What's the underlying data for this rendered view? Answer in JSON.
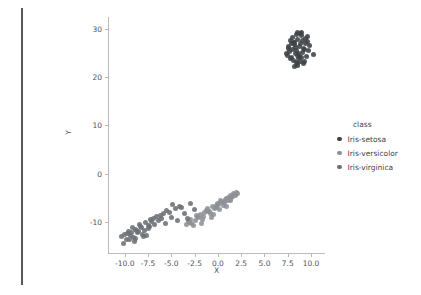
{
  "figure": {
    "background": "#ffffff",
    "panel_edge_color": "#555a5e"
  },
  "axis": {
    "xlabel": "X",
    "ylabel": "Y",
    "x_ticks": [
      "-10.0",
      "-7.5",
      "-5.0",
      "-2.5",
      "0.0",
      "2.5",
      "5.0",
      "7.5",
      "10.0"
    ],
    "y_ticks": [
      "30",
      "20",
      "10",
      "0",
      "-10"
    ],
    "spine_color": "#b8bcc0",
    "tick_text_color": "#4e5357"
  },
  "legend": {
    "title": "class",
    "entries": [
      {
        "label": "Iris-setosa",
        "color": "#3f4246"
      },
      {
        "label": "Iris-versicolor",
        "color": "#8d9195"
      },
      {
        "label": "Iris-virginica",
        "color": "#6c7075"
      }
    ]
  },
  "chart_data": {
    "type": "scatter",
    "title": "",
    "xlabel": "X",
    "ylabel": "Y",
    "xlim": [
      -11.8,
      11.5
    ],
    "ylim": [
      -16.5,
      32.5
    ],
    "x_ticks": [
      -10.0,
      -7.5,
      -5.0,
      -2.5,
      0.0,
      2.5,
      5.0,
      7.5,
      10.0
    ],
    "y_ticks": [
      30,
      20,
      10,
      0,
      -10
    ],
    "grid": false,
    "legend_title": "class",
    "legend_position": "right",
    "marker_size": 5,
    "series": [
      {
        "name": "Iris-setosa",
        "color": "#3f4246",
        "points": [
          [
            8.6,
            27.9
          ],
          [
            9.0,
            28.6
          ],
          [
            8.2,
            27.2
          ],
          [
            9.4,
            28.0
          ],
          [
            8.8,
            26.4
          ],
          [
            7.9,
            26.9
          ],
          [
            9.2,
            26.0
          ],
          [
            8.4,
            25.6
          ],
          [
            9.6,
            27.4
          ],
          [
            8.0,
            28.3
          ],
          [
            8.9,
            29.0
          ],
          [
            7.6,
            25.9
          ],
          [
            9.8,
            26.6
          ],
          [
            8.3,
            24.9
          ],
          [
            9.1,
            25.2
          ],
          [
            7.8,
            27.6
          ],
          [
            8.7,
            23.8
          ],
          [
            9.5,
            24.4
          ],
          [
            8.1,
            23.5
          ],
          [
            8.5,
            22.9
          ],
          [
            9.3,
            23.2
          ],
          [
            7.5,
            24.6
          ],
          [
            10.3,
            24.8
          ],
          [
            8.6,
            22.4
          ],
          [
            9.0,
            24.1
          ],
          [
            7.7,
            25.3
          ],
          [
            8.2,
            26.8
          ],
          [
            9.7,
            25.5
          ],
          [
            8.9,
            27.1
          ],
          [
            8.4,
            28.8
          ],
          [
            7.4,
            25.0
          ],
          [
            9.2,
            22.8
          ],
          [
            8.0,
            25.7
          ],
          [
            8.8,
            24.3
          ],
          [
            9.4,
            26.9
          ],
          [
            7.9,
            24.1
          ],
          [
            8.5,
            29.3
          ],
          [
            9.1,
            27.7
          ],
          [
            8.3,
            26.2
          ],
          [
            8.7,
            25.0
          ],
          [
            7.6,
            26.4
          ],
          [
            9.6,
            28.5
          ],
          [
            8.1,
            27.3
          ],
          [
            8.9,
            23.3
          ],
          [
            9.3,
            25.8
          ],
          [
            7.8,
            23.9
          ],
          [
            8.4,
            23.1
          ],
          [
            9.0,
            29.2
          ],
          [
            8.6,
            24.6
          ],
          [
            8.2,
            22.2
          ]
        ]
      },
      {
        "name": "Iris-versicolor",
        "color": "#8d9195",
        "points": [
          [
            -1.9,
            -8.5
          ],
          [
            -0.6,
            -6.9
          ],
          [
            0.4,
            -5.8
          ],
          [
            1.1,
            -4.9
          ],
          [
            -2.4,
            -9.8
          ],
          [
            -1.2,
            -7.6
          ],
          [
            0.9,
            -5.2
          ],
          [
            1.8,
            -4.3
          ],
          [
            -0.2,
            -7.0
          ],
          [
            -2.8,
            -10.4
          ],
          [
            0.1,
            -6.4
          ],
          [
            1.5,
            -5.0
          ],
          [
            -1.5,
            -8.9
          ],
          [
            -0.9,
            -7.9
          ],
          [
            0.7,
            -6.1
          ],
          [
            2.0,
            -3.9
          ],
          [
            -2.1,
            -9.2
          ],
          [
            -0.4,
            -7.3
          ],
          [
            1.3,
            -4.6
          ],
          [
            -3.1,
            -10.1
          ],
          [
            0.3,
            -5.5
          ],
          [
            -1.7,
            -9.5
          ],
          [
            1.7,
            -4.1
          ],
          [
            -0.8,
            -8.2
          ],
          [
            0.6,
            -6.7
          ],
          [
            -2.6,
            -10.8
          ],
          [
            1.0,
            -5.6
          ],
          [
            -1.1,
            -7.2
          ],
          [
            0.0,
            -6.2
          ],
          [
            -3.4,
            -10.6
          ],
          [
            1.9,
            -4.5
          ],
          [
            -0.5,
            -8.6
          ],
          [
            0.8,
            -5.3
          ],
          [
            -2.2,
            -9.0
          ],
          [
            1.4,
            -5.7
          ],
          [
            -1.4,
            -8.0
          ],
          [
            0.2,
            -7.5
          ],
          [
            -0.1,
            -6.6
          ],
          [
            1.6,
            -4.8
          ],
          [
            -2.9,
            -9.6
          ],
          [
            -1.8,
            -10.3
          ],
          [
            0.5,
            -6.0
          ],
          [
            1.2,
            -5.4
          ],
          [
            -0.7,
            -9.1
          ],
          [
            -2.3,
            -8.7
          ],
          [
            0.9,
            -6.8
          ],
          [
            -1.0,
            -7.8
          ],
          [
            2.1,
            -4.2
          ],
          [
            -3.2,
            -9.9
          ],
          [
            -0.3,
            -7.1
          ]
        ]
      },
      {
        "name": "Iris-virginica",
        "color": "#6c7075",
        "points": [
          [
            -8.9,
            -11.6
          ],
          [
            -9.4,
            -12.9
          ],
          [
            -8.3,
            -11.0
          ],
          [
            -7.8,
            -10.2
          ],
          [
            -9.8,
            -13.8
          ],
          [
            -8.6,
            -12.3
          ],
          [
            -7.2,
            -9.6
          ],
          [
            -6.6,
            -9.0
          ],
          [
            -9.1,
            -13.2
          ],
          [
            -10.1,
            -14.5
          ],
          [
            -8.1,
            -12.6
          ],
          [
            -7.5,
            -10.8
          ],
          [
            -9.6,
            -12.1
          ],
          [
            -8.8,
            -13.5
          ],
          [
            -6.9,
            -9.3
          ],
          [
            -5.8,
            -8.4
          ],
          [
            -9.2,
            -11.3
          ],
          [
            -7.9,
            -11.8
          ],
          [
            -6.2,
            -8.8
          ],
          [
            -10.3,
            -13.1
          ],
          [
            -8.4,
            -10.5
          ],
          [
            -9.0,
            -14.2
          ],
          [
            -7.1,
            -10.0
          ],
          [
            -8.7,
            -11.9
          ],
          [
            -5.2,
            -8.1
          ],
          [
            -9.7,
            -12.5
          ],
          [
            -6.4,
            -9.8
          ],
          [
            -8.0,
            -13.0
          ],
          [
            -7.4,
            -11.5
          ],
          [
            -10.0,
            -12.7
          ],
          [
            -5.5,
            -7.6
          ],
          [
            -8.5,
            -12.0
          ],
          [
            -6.8,
            -10.6
          ],
          [
            -9.3,
            -12.2
          ],
          [
            -7.7,
            -12.8
          ],
          [
            -4.6,
            -7.2
          ],
          [
            -8.2,
            -11.2
          ],
          [
            -9.5,
            -13.6
          ],
          [
            -6.1,
            -9.4
          ],
          [
            -7.3,
            -11.1
          ],
          [
            -4.1,
            -6.8
          ],
          [
            -5.0,
            -9.1
          ],
          [
            -3.6,
            -8.3
          ],
          [
            -4.9,
            -6.5
          ],
          [
            -3.9,
            -7.0
          ],
          [
            -2.9,
            -6.3
          ],
          [
            -3.3,
            -9.3
          ],
          [
            -2.5,
            -7.4
          ],
          [
            -5.6,
            -10.4
          ],
          [
            -4.3,
            -9.7
          ]
        ]
      }
    ]
  }
}
